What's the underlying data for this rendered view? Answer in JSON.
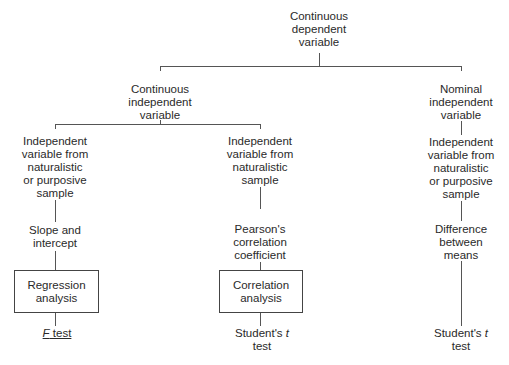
{
  "diagram": {
    "root": {
      "label_lines": [
        "Continuous",
        "dependent",
        "variable"
      ]
    },
    "branches": {
      "continuous_iv": {
        "label_lines": [
          "Continuous",
          "independent",
          "variable"
        ]
      },
      "nominal_iv": {
        "label_lines": [
          "Nominal",
          "independent",
          "variable"
        ]
      }
    },
    "columns": [
      {
        "sample_lines": [
          "Independent",
          "variable from",
          "naturalistic",
          "or purposive",
          "sample"
        ],
        "statistic_lines": [
          "Slope and",
          "intercept"
        ],
        "analysis_lines": [
          "Regression",
          "analysis"
        ],
        "test": {
          "italic": "F",
          "rest": " test"
        }
      },
      {
        "sample_lines": [
          "Independent",
          "variable from",
          "naturalistic",
          "sample"
        ],
        "statistic_lines": [
          "Pearson's",
          "correlation",
          "coefficient"
        ],
        "analysis_lines": [
          "Correlation",
          "analysis"
        ],
        "test": {
          "line1_plain": "Student's ",
          "line1_italic": "t",
          "line2": "test"
        }
      },
      {
        "sample_lines": [
          "Independent",
          "variable from",
          "naturalistic",
          "or purposive",
          "sample"
        ],
        "statistic_lines": [
          "Difference",
          "between",
          "means"
        ],
        "test": {
          "line1_plain": "Student's ",
          "line1_italic": "t",
          "line2": "test"
        }
      }
    ]
  }
}
